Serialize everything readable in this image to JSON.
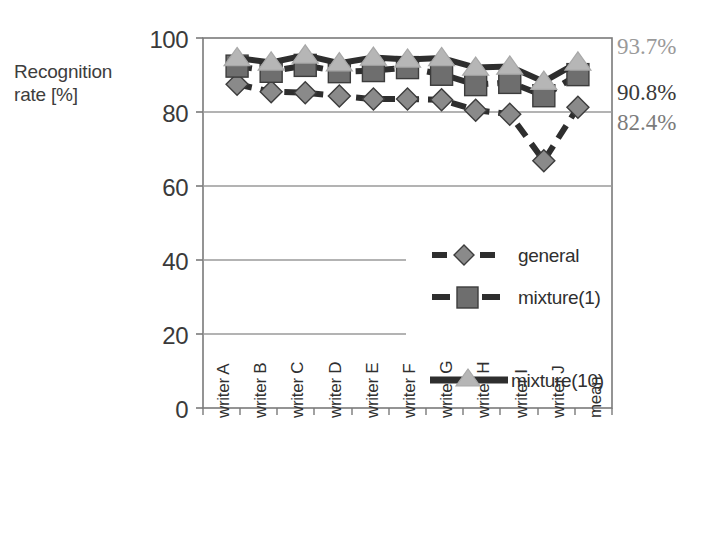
{
  "chart_data": {
    "type": "line",
    "title": "",
    "xlabel": "",
    "ylabel": "Recognition rate [%]",
    "ylim": [
      0,
      100
    ],
    "yticks": [
      0,
      20,
      40,
      60,
      80,
      100
    ],
    "grid": true,
    "legend_position": "inside-lower-right",
    "categories": [
      "writer A",
      "writer B",
      "writer C",
      "writer D",
      "writer E",
      "writer F",
      "writer G",
      "writer H",
      "writer I",
      "writer J",
      "mean"
    ],
    "series": [
      {
        "name": "general",
        "marker": "diamond",
        "line_style": "dashed",
        "marker_color": "#8a8a8a",
        "line_color": "#2e2e2e",
        "values": [
          87.5,
          85.5,
          85.2,
          84.3,
          83.5,
          83.5,
          83.3,
          80.5,
          79.4,
          66.8,
          81.3
        ]
      },
      {
        "name": "mixture(1)",
        "marker": "square",
        "line_style": "dashed",
        "marker_color": "#6e6e6e",
        "line_color": "#2e2e2e",
        "values": [
          92.4,
          91.0,
          92.6,
          90.9,
          91.2,
          92.0,
          90.2,
          87.4,
          88.0,
          84.4,
          90.1
        ]
      },
      {
        "name": "mixture(10)",
        "marker": "triangle",
        "line_style": "solid",
        "marker_color": "#b6b6b6",
        "line_color": "#2e2e2e",
        "values": [
          94.6,
          93.4,
          95.3,
          93.2,
          94.7,
          94.2,
          94.6,
          92.0,
          92.3,
          88.2,
          93.4
        ]
      }
    ],
    "annotations": [
      {
        "text": "93.7%",
        "series": "mixture(10)",
        "color": "#9a9a9a"
      },
      {
        "text": "90.8%",
        "series": "mixture(1)",
        "color": "#3a3a3a"
      },
      {
        "text": "82.4%",
        "series": "general",
        "color": "#7b7b7b"
      }
    ]
  },
  "axis": {
    "y_title_line1": "Recognition",
    "y_title_line2": "rate [%]",
    "yticks": [
      "100",
      "80",
      "60",
      "40",
      "20",
      "0"
    ],
    "xticks": [
      "writer A",
      "writer B",
      "writer C",
      "writer D",
      "writer E",
      "writer F",
      "writer G",
      "writer H",
      "writer I",
      "writer J",
      "mean"
    ]
  },
  "legend": {
    "items": [
      {
        "label": "general"
      },
      {
        "label": "mixture(1)"
      },
      {
        "label": "mixture(10)"
      }
    ]
  },
  "annotations": {
    "top": "93.7%",
    "middle": "90.8%",
    "bottom": "82.4%"
  }
}
